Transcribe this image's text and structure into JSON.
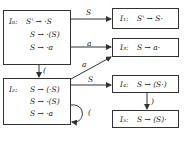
{
  "diagram": {
    "type": "LR(0) automaton",
    "states": [
      {
        "id": "I0",
        "label": "I₀:",
        "items": [
          "S' → ·S",
          "S → ·(S)",
          "S → ·a"
        ]
      },
      {
        "id": "I1",
        "label": "I₁:",
        "items": [
          "S' → S·"
        ]
      },
      {
        "id": "I2",
        "label": "I₂:",
        "items": [
          "S → (·S)",
          "S → ·(S)",
          "S → ·a"
        ]
      },
      {
        "id": "I3",
        "label": "I₃:",
        "items": [
          "S → a·"
        ]
      },
      {
        "id": "I4",
        "label": "I₄:",
        "items": [
          "S → (S·)"
        ]
      },
      {
        "id": "I5",
        "label": "I₅:",
        "items": [
          "S → (S)·"
        ]
      }
    ],
    "edges": [
      {
        "from": "I0",
        "to": "I1",
        "label": "S"
      },
      {
        "from": "I0",
        "to": "I3",
        "label": "a"
      },
      {
        "from": "I0",
        "to": "I2",
        "label": "("
      },
      {
        "from": "I2",
        "to": "I3",
        "label": "a"
      },
      {
        "from": "I2",
        "to": "I4",
        "label": "S"
      },
      {
        "from": "I2",
        "to": "I2",
        "label": "("
      },
      {
        "from": "I4",
        "to": "I5",
        "label": ")"
      }
    ]
  }
}
